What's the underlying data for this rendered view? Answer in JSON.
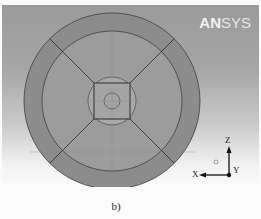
{
  "viewer": {
    "logo": {
      "bold": "AN",
      "light": "SYS"
    },
    "background_top": "#9a9a9a",
    "background_bottom": "#fbfbfb"
  },
  "model": {
    "type": "circular cross-section mesh",
    "outer_ring_color": "#8c8c8c",
    "inner_region_color": "#9c9c9c",
    "core_color": "#a8a8a8",
    "edge_color": "#3a3a3a"
  },
  "triad": {
    "z_label": "Z",
    "x_label": "X",
    "y_label": "Y"
  },
  "caption": "b)"
}
